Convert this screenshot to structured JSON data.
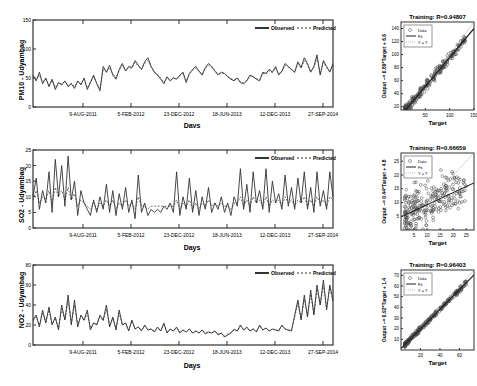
{
  "chart_data": [
    {
      "type": "line",
      "panel": "time-series",
      "ylabel": "PM10 - Udyambag",
      "xlabel": "Days",
      "ylim": [
        0,
        150
      ],
      "yticks": [
        "0",
        "50",
        "100",
        "150"
      ],
      "xticks": [
        "9-AUG-2011",
        "5-FEB-2012",
        "23-DEC-2012",
        "18-JUN-2013",
        "12-DEC-2013",
        "27-SEP-2014"
      ],
      "legend": [
        "Observed",
        "Predicted"
      ],
      "legend_position": "upper right",
      "series": [
        {
          "name": "Observed",
          "style": "solid",
          "values": [
            55,
            45,
            60,
            40,
            50,
            35,
            48,
            30,
            42,
            38,
            45,
            35,
            40,
            32,
            45,
            38,
            50,
            30,
            42,
            55,
            40,
            28,
            70,
            60,
            72,
            55,
            48,
            65,
            75,
            62,
            70,
            68,
            80,
            72,
            65,
            78,
            85,
            70,
            60,
            55,
            48,
            40,
            52,
            45,
            50,
            48,
            55,
            60,
            42,
            58,
            65,
            70,
            62,
            55,
            68,
            75,
            70,
            62,
            55,
            60,
            58,
            52,
            48,
            45,
            50,
            42,
            40,
            45,
            55,
            52,
            48,
            45,
            60,
            58,
            65,
            60,
            70,
            55,
            62,
            75,
            70,
            65,
            60,
            78,
            68,
            85,
            75,
            60,
            70,
            90,
            55,
            80,
            70,
            60,
            75
          ]
        },
        {
          "name": "Predicted",
          "style": "dashed",
          "values": [
            52,
            47,
            55,
            43,
            48,
            38,
            46,
            34,
            42,
            40,
            44,
            37,
            41,
            35,
            44,
            40,
            48,
            33,
            43,
            52,
            41,
            32,
            66,
            60,
            68,
            57,
            50,
            63,
            72,
            62,
            68,
            67,
            77,
            70,
            65,
            75,
            80,
            69,
            61,
            56,
            50,
            43,
            51,
            46,
            50,
            49,
            54,
            58,
            45,
            57,
            63,
            67,
            61,
            56,
            66,
            72,
            68,
            62,
            57,
            59,
            57,
            53,
            49,
            47,
            50,
            44,
            42,
            46,
            54,
            52,
            49,
            47,
            58,
            57,
            63,
            59,
            67,
            57,
            61,
            72,
            68,
            64,
            60,
            75,
            67,
            80,
            72,
            61,
            68,
            85,
            57,
            77,
            68,
            61,
            72
          ]
        }
      ]
    },
    {
      "type": "scatter",
      "panel": "regression",
      "title": "Training: R=0.94807",
      "xlabel": "Target",
      "ylabel": "Output ~= 0.89*Target + 6.6",
      "xlim": [
        0,
        150
      ],
      "ylim": [
        15,
        150
      ],
      "xticks": [
        "50",
        "100",
        "150"
      ],
      "yticks": [
        "20",
        "40",
        "60",
        "80",
        "100",
        "120",
        "140"
      ],
      "legend": [
        "Data",
        "Fit",
        "Y = T"
      ],
      "fit": {
        "slope": 0.89,
        "intercept": 6.6
      },
      "R": 0.94807
    },
    {
      "type": "line",
      "panel": "time-series",
      "ylabel": "SO2 - Udyambag",
      "xlabel": "Days",
      "ylim": [
        0,
        25
      ],
      "yticks": [
        "0",
        "5",
        "10",
        "15",
        "20",
        "25"
      ],
      "xticks": [
        "9-AUG-2011",
        "5-FEB-2012",
        "23-DEC-2012",
        "18-JUN-2013",
        "12-DEC-2013",
        "27-SEP-2014"
      ],
      "legend": [
        "Observed",
        "Predicted"
      ],
      "legend_position": "upper right",
      "series": [
        {
          "name": "Observed",
          "style": "solid",
          "values": [
            10,
            16,
            6,
            12,
            8,
            18,
            5,
            22,
            10,
            20,
            7,
            23,
            9,
            15,
            4,
            12,
            8,
            6,
            4,
            9,
            5,
            10,
            6,
            14,
            5,
            12,
            4,
            11,
            6,
            13,
            5,
            9,
            3,
            17,
            5,
            8,
            4,
            6,
            5,
            6,
            5,
            7,
            6,
            8,
            5,
            18,
            4,
            10,
            6,
            16,
            5,
            12,
            4,
            10,
            6,
            13,
            5,
            8,
            6,
            10,
            5,
            8,
            4,
            10,
            7,
            19,
            6,
            14,
            5,
            18,
            8,
            12,
            6,
            19,
            5,
            15,
            8,
            11,
            6,
            17,
            7,
            13,
            6,
            16,
            8,
            18,
            6,
            13,
            5,
            18,
            7,
            12,
            6,
            18,
            10
          ]
        },
        {
          "name": "Predicted",
          "style": "dashed",
          "values": [
            9,
            12,
            8,
            10,
            9,
            12,
            8,
            13,
            10,
            12,
            9,
            13,
            9,
            11,
            7,
            9,
            8,
            7,
            6,
            8,
            6,
            8,
            7,
            9,
            7,
            9,
            6,
            8,
            7,
            9,
            7,
            8,
            6,
            10,
            7,
            7,
            6,
            7,
            7,
            7,
            7,
            7,
            7,
            7,
            7,
            9,
            6,
            8,
            7,
            9,
            6,
            8,
            6,
            8,
            7,
            9,
            7,
            8,
            7,
            8,
            7,
            7,
            6,
            8,
            8,
            10,
            7,
            9,
            7,
            10,
            8,
            9,
            7,
            10,
            7,
            9,
            8,
            9,
            7,
            10,
            8,
            9,
            7,
            9,
            8,
            10,
            7,
            9,
            7,
            10,
            8,
            9,
            7,
            10,
            9
          ]
        }
      ]
    },
    {
      "type": "scatter",
      "panel": "regression",
      "title": "Training: R=0.66659",
      "xlabel": "Target",
      "ylabel": "Output ~= 0.44*Target + 4.8",
      "xlim": [
        0,
        28
      ],
      "ylim": [
        0,
        28
      ],
      "xticks": [
        "5",
        "10",
        "15",
        "20",
        "25"
      ],
      "yticks": [
        "5",
        "10",
        "15",
        "20",
        "25"
      ],
      "legend": [
        "Data",
        "Fit",
        "Y = T"
      ],
      "fit": {
        "slope": 0.44,
        "intercept": 4.8
      },
      "R": 0.66659
    },
    {
      "type": "line",
      "panel": "time-series",
      "ylabel": "NO2 - Udyambag",
      "xlabel": "Days",
      "ylim": [
        0,
        80
      ],
      "yticks": [
        "0",
        "20",
        "40",
        "60",
        "80"
      ],
      "xticks": [
        "9-AUG-2011",
        "5-FEB-2012",
        "23-DEC-2012",
        "18-JUN-2013",
        "12-DEC-2013",
        "27-SEP-2014"
      ],
      "legend": [
        "Observed",
        "Predicted"
      ],
      "legend_position": "upper right",
      "series": [
        {
          "name": "Observed",
          "style": "solid",
          "values": [
            25,
            30,
            18,
            35,
            22,
            38,
            20,
            28,
            15,
            40,
            25,
            50,
            20,
            45,
            18,
            30,
            25,
            35,
            15,
            22,
            20,
            30,
            25,
            40,
            18,
            28,
            15,
            35,
            20,
            22,
            14,
            25,
            16,
            18,
            14,
            20,
            15,
            16,
            13,
            18,
            14,
            22,
            12,
            16,
            14,
            18,
            12,
            15,
            13,
            16,
            12,
            14,
            12,
            15,
            11,
            13,
            12,
            14,
            10,
            12,
            8,
            10,
            12,
            16,
            14,
            20,
            15,
            18,
            14,
            16,
            13,
            20,
            15,
            17,
            14,
            16,
            15,
            14,
            20,
            16,
            15,
            14,
            30,
            45,
            25,
            50,
            28,
            55,
            30,
            60,
            40,
            65,
            35,
            60,
            45
          ]
        },
        {
          "name": "Predicted",
          "style": "dashed",
          "values": [
            24,
            28,
            20,
            32,
            23,
            35,
            21,
            27,
            17,
            36,
            25,
            44,
            22,
            40,
            20,
            29,
            24,
            32,
            17,
            22,
            21,
            28,
            24,
            36,
            19,
            27,
            17,
            32,
            20,
            22,
            15,
            24,
            16,
            18,
            15,
            19,
            15,
            16,
            14,
            17,
            14,
            20,
            13,
            16,
            14,
            17,
            13,
            15,
            13,
            16,
            12,
            14,
            12,
            15,
            12,
            13,
            12,
            14,
            11,
            12,
            9,
            11,
            12,
            15,
            14,
            19,
            15,
            17,
            14,
            16,
            14,
            19,
            15,
            17,
            14,
            16,
            15,
            15,
            19,
            16,
            15,
            15,
            28,
            42,
            26,
            46,
            29,
            51,
            31,
            56,
            40,
            60,
            37,
            57,
            44
          ]
        }
      ]
    },
    {
      "type": "scatter",
      "panel": "regression",
      "title": "Training: R=0.96403",
      "xlabel": "Target",
      "ylabel": "Output ~= 0.92*Target + 1.4",
      "xlim": [
        0,
        75
      ],
      "ylim": [
        0,
        75
      ],
      "xticks": [
        "20",
        "40",
        "60"
      ],
      "yticks": [
        "10",
        "20",
        "30",
        "40",
        "50",
        "60",
        "70"
      ],
      "legend": [
        "Data",
        "Fit",
        "Y = T"
      ],
      "fit": {
        "slope": 0.92,
        "intercept": 1.4
      },
      "R": 0.96403
    }
  ],
  "rows": [
    {
      "ts": {
        "ylabel": "PM10 - Udyambag",
        "xlabel": "Days",
        "yticks": [
          "0",
          "50",
          "100",
          "150"
        ],
        "xticks": [
          "9-AUG-2011",
          "5-FEB-2012",
          "23-DEC-2012",
          "18-JUN-2013",
          "12-DEC-2013",
          "27-SEP-2014"
        ],
        "legend_observed": "Observed",
        "legend_predicted": "Predicted"
      },
      "sc": {
        "title": "Training: R=0.94807",
        "xlabel": "Target",
        "ylabel": "Output ~= 0.89*Target + 6.6",
        "xticks": [
          "50",
          "100",
          "150"
        ],
        "yticks": [
          "20",
          "40",
          "60",
          "80",
          "100",
          "120",
          "140"
        ],
        "legend": [
          "Data",
          "Fit",
          "Y = T"
        ]
      }
    },
    {
      "ts": {
        "ylabel": "SO2 - Udyambag",
        "xlabel": "Days",
        "yticks": [
          "0",
          "5",
          "10",
          "15",
          "20",
          "25"
        ],
        "xticks": [
          "9-AUG-2011",
          "5-FEB-2012",
          "23-DEC-2012",
          "18-JUN-2013",
          "12-DEC-2013",
          "27-SEP-2014"
        ],
        "legend_observed": "Observed",
        "legend_predicted": "Predicted"
      },
      "sc": {
        "title": "Training: R=0.66659",
        "xlabel": "Target",
        "ylabel": "Output ~= 0.44*Target + 4.8",
        "xticks": [
          "5",
          "10",
          "15",
          "20",
          "25"
        ],
        "yticks": [
          "5",
          "10",
          "15",
          "20",
          "25"
        ],
        "legend": [
          "Data",
          "Fit",
          "Y = T"
        ]
      }
    },
    {
      "ts": {
        "ylabel": "NO2 - Udyambag",
        "xlabel": "Days",
        "yticks": [
          "0",
          "20",
          "40",
          "60",
          "80"
        ],
        "xticks": [
          "9-AUG-2011",
          "5-FEB-2012",
          "23-DEC-2012",
          "18-JUN-2013",
          "12-DEC-2013",
          "27-SEP-2014"
        ],
        "legend_observed": "Observed",
        "legend_predicted": "Predicted"
      },
      "sc": {
        "title": "Training: R=0.96403",
        "xlabel": "Target",
        "ylabel": "Output ~= 0.92*Target + 1.4",
        "xticks": [
          "20",
          "40",
          "60"
        ],
        "yticks": [
          "10",
          "20",
          "30",
          "40",
          "50",
          "60",
          "70"
        ],
        "legend": [
          "Data",
          "Fit",
          "Y = T"
        ]
      }
    }
  ],
  "colors": {
    "line": "#333333",
    "axis": "#333333",
    "marker": "#444444",
    "fit": "#222222",
    "identity": "#999999"
  }
}
